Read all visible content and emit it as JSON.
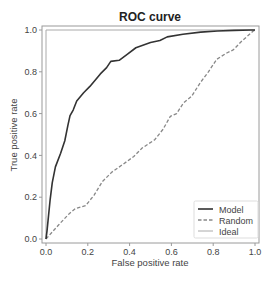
{
  "chart_data": {
    "type": "line",
    "title": "ROC curve",
    "xlabel": "False positive rate",
    "ylabel": "True positive rate",
    "xlim": [
      0.0,
      1.0
    ],
    "ylim": [
      0.0,
      1.0
    ],
    "xticks": [
      "0.0",
      "0.2",
      "0.4",
      "0.6",
      "0.8",
      "1.0"
    ],
    "yticks": [
      "0.0",
      "0.2",
      "0.4",
      "0.6",
      "0.8",
      "1.0"
    ],
    "grid": false,
    "legend_position": "lower right",
    "series": [
      {
        "name": "Model",
        "style": "solid",
        "color": "#333333",
        "width": 1.6,
        "x": [
          0.0,
          0.005,
          0.01,
          0.02,
          0.03,
          0.045,
          0.07,
          0.09,
          0.105,
          0.115,
          0.13,
          0.147,
          0.18,
          0.21,
          0.26,
          0.29,
          0.31,
          0.35,
          0.39,
          0.43,
          0.5,
          0.545,
          0.58,
          0.655,
          0.74,
          0.82,
          0.9,
          0.98,
          1.0
        ],
        "y": [
          0.0,
          0.04,
          0.09,
          0.19,
          0.27,
          0.345,
          0.41,
          0.47,
          0.545,
          0.59,
          0.617,
          0.66,
          0.7,
          0.73,
          0.79,
          0.82,
          0.85,
          0.855,
          0.885,
          0.915,
          0.94,
          0.95,
          0.967,
          0.98,
          0.99,
          0.995,
          0.998,
          1.0,
          1.0
        ]
      },
      {
        "name": "Random",
        "style": "dashed",
        "color": "#888888",
        "width": 1.3,
        "x": [
          0.0,
          0.06,
          0.11,
          0.14,
          0.19,
          0.23,
          0.27,
          0.315,
          0.365,
          0.42,
          0.46,
          0.52,
          0.56,
          0.595,
          0.625,
          0.657,
          0.697,
          0.737,
          0.777,
          0.817,
          0.865,
          0.896,
          0.936,
          0.99,
          1.0
        ],
        "y": [
          0.0,
          0.067,
          0.12,
          0.145,
          0.16,
          0.21,
          0.275,
          0.32,
          0.355,
          0.395,
          0.435,
          0.475,
          0.525,
          0.587,
          0.6,
          0.65,
          0.683,
          0.746,
          0.8,
          0.86,
          0.89,
          0.905,
          0.946,
          0.994,
          1.0
        ]
      },
      {
        "name": "Ideal",
        "style": "solid",
        "color": "#aaaaaa",
        "width": 1.0,
        "x": [
          0.0,
          0.0,
          1.0
        ],
        "y": [
          0.0,
          1.0,
          1.0
        ]
      }
    ]
  },
  "colors": {
    "frame": "#9a9a9a",
    "text": "#444444",
    "title": "#222222",
    "legend_border": "#dddddd"
  }
}
